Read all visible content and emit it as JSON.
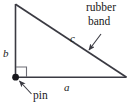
{
  "figure": {
    "kind": "geometry-diagram",
    "stroke_color": "#3a3a42",
    "background_color": "#ffffff",
    "labels": {
      "side_b": "b",
      "side_c": "c",
      "side_a": "a",
      "rubber_line1": "rubber",
      "rubber_line2": "band",
      "pin": "pin"
    },
    "annotations": {
      "right_angle_marker": "right-angle-marker",
      "pin_dot": "pin-dot",
      "rubber_band_leader": "rubber-band-arrow",
      "pin_leader": "pin-arrow"
    },
    "geometry": {
      "apex": [
        15,
        4
      ],
      "right_angle_vertex": [
        15,
        77
      ],
      "base_right_vertex": [
        126,
        77
      ],
      "right_angle_marker_size": 10
    }
  }
}
